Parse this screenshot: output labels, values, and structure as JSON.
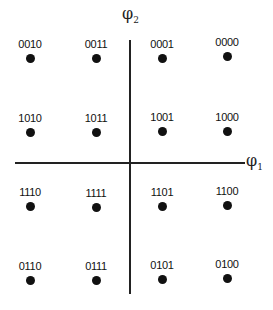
{
  "diagram": {
    "axes": {
      "horizontal_label": "φ",
      "horizontal_sub": "1",
      "vertical_label": "φ",
      "vertical_sub": "2"
    },
    "points": [
      {
        "label": "0010",
        "x": 30,
        "y": 38
      },
      {
        "label": "0011",
        "x": 96,
        "y": 38
      },
      {
        "label": "0001",
        "x": 162,
        "y": 38
      },
      {
        "label": "0000",
        "x": 227,
        "y": 36
      },
      {
        "label": "1010",
        "x": 30,
        "y": 112
      },
      {
        "label": "1011",
        "x": 96,
        "y": 112
      },
      {
        "label": "1001",
        "x": 162,
        "y": 111
      },
      {
        "label": "1000",
        "x": 227,
        "y": 111
      },
      {
        "label": "1110",
        "x": 30,
        "y": 186
      },
      {
        "label": "1111",
        "x": 96,
        "y": 187
      },
      {
        "label": "1101",
        "x": 162,
        "y": 186
      },
      {
        "label": "1100",
        "x": 227,
        "y": 185
      },
      {
        "label": "0110",
        "x": 30,
        "y": 260
      },
      {
        "label": "0111",
        "x": 96,
        "y": 260
      },
      {
        "label": "0101",
        "x": 162,
        "y": 259
      },
      {
        "label": "0100",
        "x": 227,
        "y": 258
      }
    ]
  }
}
